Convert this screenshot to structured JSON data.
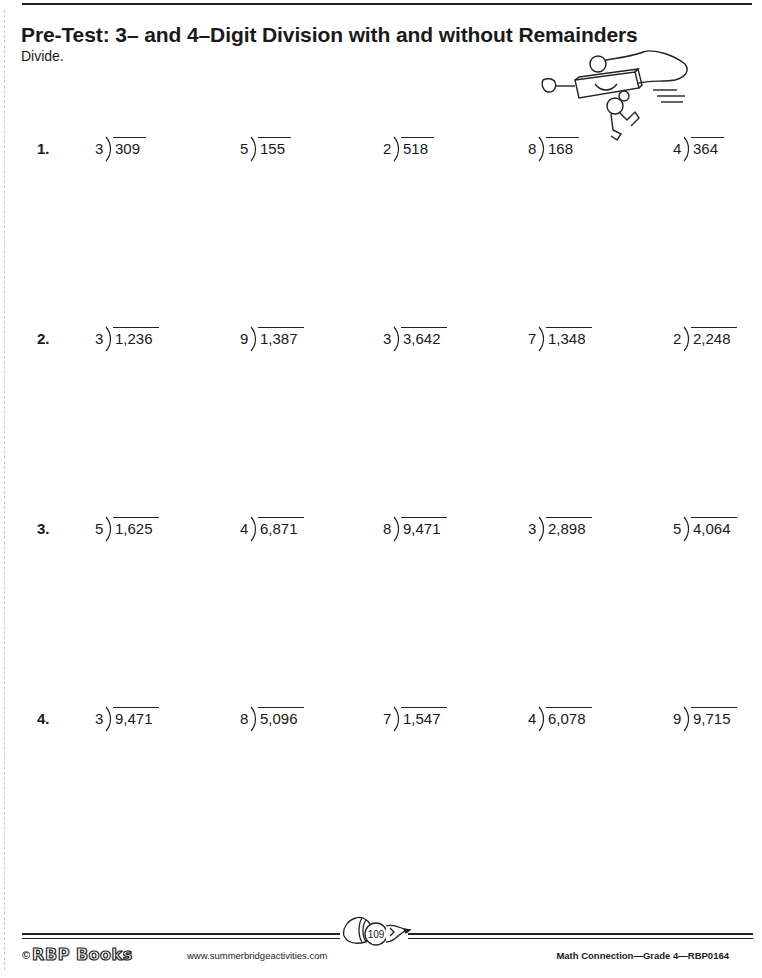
{
  "page": {
    "title": "Pre-Test: 3– and 4–Digit Division with and without Remainders",
    "instructions": "Divide."
  },
  "rows": [
    {
      "label": "1.",
      "problems": [
        {
          "divisor": "3",
          "dividend": "309"
        },
        {
          "divisor": "5",
          "dividend": "155"
        },
        {
          "divisor": "2",
          "dividend": "518"
        },
        {
          "divisor": "8",
          "dividend": "168"
        },
        {
          "divisor": "4",
          "dividend": "364"
        }
      ]
    },
    {
      "label": "2.",
      "problems": [
        {
          "divisor": "3",
          "dividend": "1,236"
        },
        {
          "divisor": "9",
          "dividend": "1,387"
        },
        {
          "divisor": "3",
          "dividend": "3,642"
        },
        {
          "divisor": "7",
          "dividend": "1,348"
        },
        {
          "divisor": "2",
          "dividend": "2,248"
        }
      ]
    },
    {
      "label": "3.",
      "problems": [
        {
          "divisor": "5",
          "dividend": "1,625"
        },
        {
          "divisor": "4",
          "dividend": "6,871"
        },
        {
          "divisor": "8",
          "dividend": "9,471"
        },
        {
          "divisor": "3",
          "dividend": "2,898"
        },
        {
          "divisor": "5",
          "dividend": "4,064"
        }
      ]
    },
    {
      "label": "4.",
      "problems": [
        {
          "divisor": "3",
          "dividend": "9,471"
        },
        {
          "divisor": "8",
          "dividend": "5,096"
        },
        {
          "divisor": "7",
          "dividend": "1,547"
        },
        {
          "divisor": "4",
          "dividend": "6,078"
        },
        {
          "divisor": "9",
          "dividend": "9,715"
        }
      ]
    }
  ],
  "footer": {
    "copyright_symbol": "©",
    "brand": "RBP Books",
    "website": "www.summerbridgeactivities.com",
    "page_number": "109",
    "book_info": "Math Connection—Grade 4—RBP0164"
  },
  "icons": {
    "mascot": "flying-ruler-superhero-icon",
    "page_badge": "pencil-icon"
  }
}
